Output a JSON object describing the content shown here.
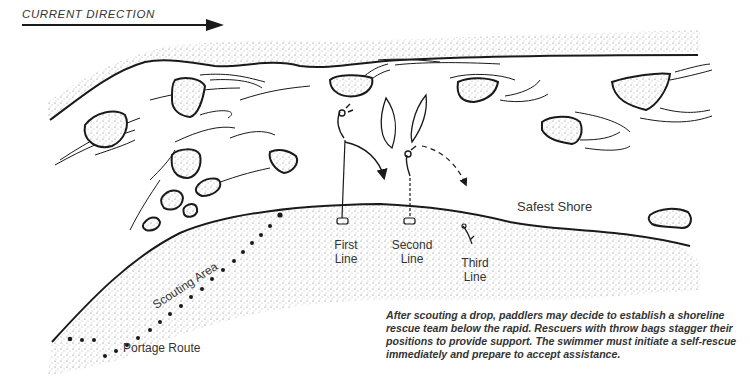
{
  "diagram": {
    "current_direction": {
      "label": "CURRENT DIRECTION",
      "arrow": "right"
    },
    "labels": {
      "safest_shore": "Safest Shore",
      "first_line": "First Line",
      "first_line_1": "First",
      "first_line_2": "Line",
      "second_line_1": "Second",
      "second_line_2": "Line",
      "third_line_1": "Third",
      "third_line_2": "Line",
      "scouting_area": "Scouting Area",
      "portage_route": "Portage Route"
    },
    "caption": "After scouting a drop, paddlers may decide to establish a shoreline rescue team below the rapid. Rescuers with throw bags stagger their positions to provide support. The swimmer must initiate a self-rescue immediately and prepare to accept assistance.",
    "colors": {
      "ink": "#1a1a1a",
      "shore": "#cfcfcf",
      "background": "#ffffff"
    }
  }
}
